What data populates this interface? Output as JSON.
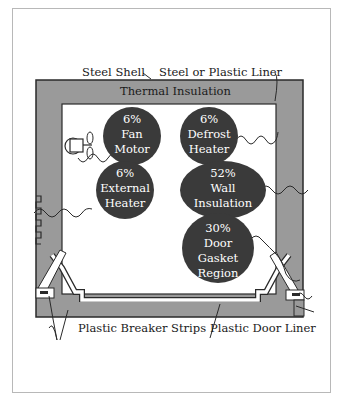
{
  "figure": {
    "labels": {
      "steel_shell": "Steel Shell",
      "liner": "Steel or Plastic Liner",
      "insulation": "Thermal Insulation",
      "breaker_strips": "Plastic Breaker Strips",
      "door_liner": "Plastic Door Liner"
    },
    "heat_sources": [
      {
        "id": "fan-motor",
        "percent": "6%",
        "line1": "Fan",
        "line2": "Motor"
      },
      {
        "id": "defrost-heater",
        "percent": "6%",
        "line1": "Defrost",
        "line2": "Heater"
      },
      {
        "id": "external-heater",
        "percent": "6%",
        "line1": "External",
        "line2": "Heater"
      },
      {
        "id": "wall-insulation",
        "percent": "52%",
        "line1": "Wall",
        "line2": "Insulation"
      },
      {
        "id": "door-gasket",
        "percent": "30%",
        "line1": "Door",
        "line2": "Gasket",
        "line3": "Region"
      }
    ],
    "colors": {
      "shell": "#9a9a9a",
      "bubble": "#3a3a3a",
      "interior": "#ffffff",
      "outline": "#2a2a2a"
    }
  }
}
